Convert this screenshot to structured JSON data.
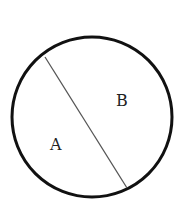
{
  "diagram": {
    "type": "circle-divided-by-chord",
    "circle": {
      "cx": 92,
      "cy": 117,
      "r": 80,
      "stroke": "#111111",
      "stroke_width": 3
    },
    "chord": {
      "x1": 45,
      "y1": 57,
      "x2": 127,
      "y2": 188,
      "stroke": "#555555",
      "stroke_width": 1.3
    },
    "regions": [
      {
        "label": "A",
        "x": 50,
        "y": 150
      },
      {
        "label": "B",
        "x": 116,
        "y": 106
      }
    ]
  }
}
